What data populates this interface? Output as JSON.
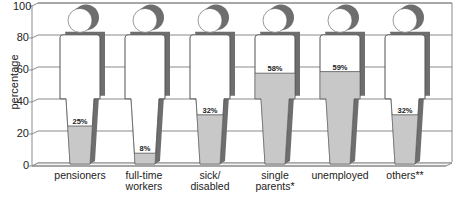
{
  "chart_data": {
    "type": "bar",
    "title": "",
    "xlabel": "",
    "ylabel": "percentage",
    "ylim": [
      0,
      100
    ],
    "yticks": [
      0,
      20,
      40,
      60,
      80,
      100
    ],
    "grid": true,
    "style": "pictogram-person-fill-3d",
    "categories": [
      "pensioners",
      "full-time workers",
      "sick/ disabled",
      "single parents*",
      "unemployed",
      "others**"
    ],
    "values": [
      25,
      8,
      32,
      58,
      59,
      32
    ],
    "value_labels": [
      "25%",
      "8%",
      "32%",
      "58%",
      "59%",
      "32%"
    ]
  },
  "axis": {
    "ylabel": "percentage",
    "ticks": [
      "0",
      "20",
      "40",
      "60",
      "80",
      "100"
    ]
  },
  "categories": [
    {
      "line1": "pensioners",
      "line2": "",
      "value": 25,
      "label": "25%"
    },
    {
      "line1": "full-time",
      "line2": "workers",
      "value": 8,
      "label": "8%"
    },
    {
      "line1": "sick/",
      "line2": "disabled",
      "value": 32,
      "label": "32%"
    },
    {
      "line1": "single",
      "line2": "parents*",
      "value": 58,
      "label": "58%"
    },
    {
      "line1": "unemployed",
      "line2": "",
      "value": 59,
      "label": "59%"
    },
    {
      "line1": "others**",
      "line2": "",
      "value": 32,
      "label": "32%"
    }
  ],
  "colors": {
    "fill": "#c8c8c8",
    "shadow": "#6e6e6e",
    "outline": "#555555",
    "grid": "#8a8a8a"
  }
}
